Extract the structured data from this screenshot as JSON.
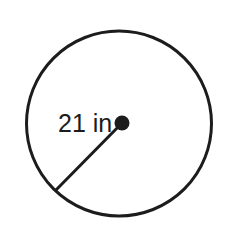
{
  "figure": {
    "kind": "geometry-diagram",
    "background_color": "#ffffff",
    "stroke_color": "#1c1c1c",
    "label_color": "#1c1c1c"
  },
  "labels": {
    "radius_label": "21 in"
  },
  "chart_data": {
    "type": "diagram",
    "title": "",
    "shapes": [
      {
        "name": "circle-outline",
        "type": "circle",
        "center": [
          119,
          123.5
        ],
        "radius": 92.5,
        "stroke": "#1c1c1c",
        "stroke_width": 3,
        "fill": "none"
      },
      {
        "name": "center-point",
        "type": "dot",
        "center": [
          122,
          123
        ],
        "radius": 7.5,
        "fill": "#1c1c1c"
      },
      {
        "name": "radius-segment",
        "type": "line",
        "from": [
          122,
          123
        ],
        "to": [
          56,
          190
        ],
        "stroke": "#1c1c1c",
        "stroke_width": 3
      }
    ],
    "annotations": [
      {
        "name": "radius-measure",
        "text": "21 in",
        "anchor": [
          58,
          132
        ],
        "font_size": 25,
        "color": "#1c1c1c",
        "describes": "radius-segment"
      }
    ],
    "measurements": {
      "radius": 21,
      "units": "in",
      "diameter": 42
    },
    "grid": false,
    "legend": null
  }
}
